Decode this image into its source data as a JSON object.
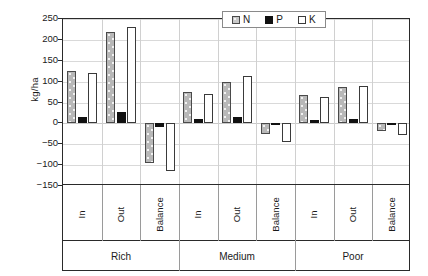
{
  "chart_data": {
    "type": "bar",
    "title": "",
    "xlabel": "",
    "ylabel": "kg/ha",
    "ylim": [
      -150,
      250
    ],
    "ytick_step": 50,
    "yticks": [
      250,
      200,
      150,
      100,
      50,
      0,
      "−50",
      "−100",
      "−150"
    ],
    "grid": true,
    "legend_position": "top-center",
    "orientation": "vertical",
    "groups": [
      "Rich",
      "Medium",
      "Poor"
    ],
    "categories": [
      "In",
      "Out",
      "Balance",
      "In",
      "Out",
      "Balance",
      "In",
      "Out",
      "Balance"
    ],
    "series": [
      {
        "name": "N",
        "values": [
          125,
          220,
          -95,
          75,
          100,
          -25,
          68,
          86,
          -18
        ]
      },
      {
        "name": "P",
        "values": [
          15,
          28,
          -8,
          11,
          15,
          -5,
          9,
          10,
          -4
        ]
      },
      {
        "name": "K",
        "values": [
          120,
          230,
          -113,
          71,
          114,
          -45,
          62,
          90,
          -28
        ]
      }
    ]
  },
  "legend": {
    "items": [
      {
        "label": "N",
        "swatch": "gray-dotted-swatch",
        "color": "#c9c9c9"
      },
      {
        "label": "P",
        "swatch": "black-swatch",
        "color": "#111111"
      },
      {
        "label": "K",
        "swatch": "white-swatch",
        "color": "#ffffff"
      }
    ]
  },
  "axis": {
    "y_title": "kg/ha"
  }
}
